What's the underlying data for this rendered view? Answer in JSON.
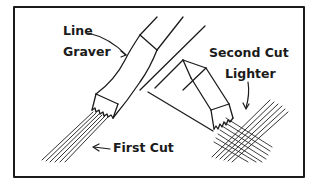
{
  "figure": {
    "type": "engraving technique illustration",
    "colors": {
      "ink": "#1b1b1b",
      "paper": "#ffffff"
    },
    "labels": {
      "tool_line1": "Line",
      "tool_line2": "Graver",
      "first_cut": "First Cut",
      "second_cut_line1": "Second Cut",
      "second_cut_line2": "Lighter"
    },
    "parts": [
      {
        "name": "line-graver-tool",
        "description": "Line graver making parallel first cut lines"
      },
      {
        "name": "second-graver-tool",
        "description": "Line graver making lighter crossing second cut"
      }
    ]
  }
}
